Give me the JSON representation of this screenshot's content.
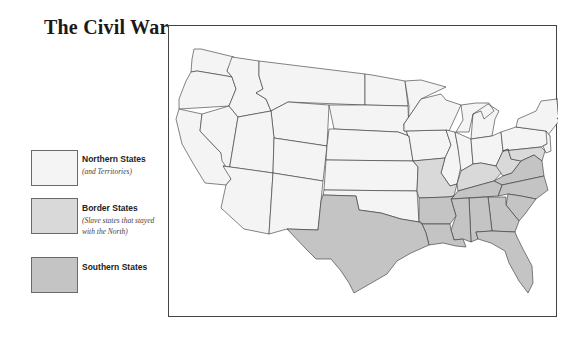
{
  "title": "The Civil War",
  "legend": {
    "items": [
      {
        "id": "northern",
        "label": "Northern States",
        "note": "(and Territories)",
        "color": "#f4f4f4"
      },
      {
        "id": "border",
        "label": "Border States",
        "note": "(Slave states that stayed with the North)",
        "note_line1": "(Slave states that stayed",
        "note_line2": "with the North)",
        "color": "#d9d9d9"
      },
      {
        "id": "southern",
        "label": "Southern States",
        "note": "",
        "color": "#c4c4c4"
      }
    ]
  },
  "map": {
    "region": "United States",
    "colors": {
      "northern": "#f4f4f4",
      "border": "#d9d9d9",
      "southern": "#c4c4c4",
      "outline": "#333333"
    },
    "groups": {
      "northern": [
        "Washington",
        "Oregon",
        "California",
        "Nevada",
        "Idaho",
        "Montana",
        "Wyoming",
        "Utah",
        "Colorado",
        "Arizona",
        "New Mexico",
        "North Dakota",
        "South Dakota",
        "Nebraska",
        "Kansas",
        "Oklahoma",
        "Minnesota",
        "Iowa",
        "Wisconsin",
        "Illinois",
        "Michigan",
        "Indiana",
        "Ohio",
        "Pennsylvania",
        "New York",
        "New Jersey",
        "Vermont",
        "New Hampshire",
        "Maine",
        "Massachusetts",
        "Connecticut",
        "Rhode Island"
      ],
      "border": [
        "Missouri",
        "Kentucky",
        "West Virginia",
        "Maryland",
        "Delaware"
      ],
      "southern": [
        "Texas",
        "Arkansas",
        "Louisiana",
        "Tennessee",
        "Mississippi",
        "Alabama",
        "Georgia",
        "Florida",
        "South Carolina",
        "North Carolina",
        "Virginia"
      ]
    }
  }
}
